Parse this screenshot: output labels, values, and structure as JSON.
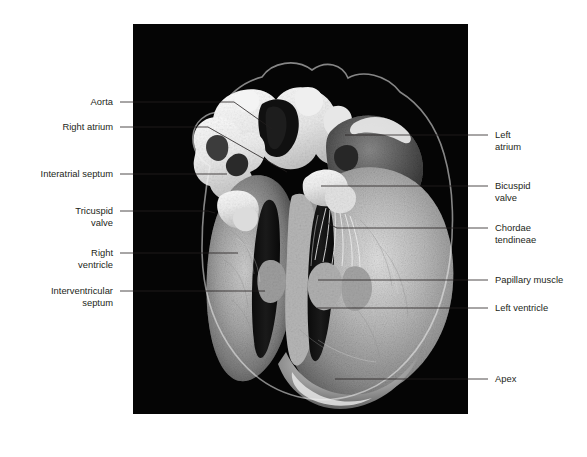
{
  "figure": {
    "type": "anatomical-photograph",
    "photo_style": "black-and-white dissection photograph on black background",
    "background_color": "#ffffff",
    "photo_background_color": "#050505",
    "label_color": "#231f20",
    "leader_color": "#231f20",
    "photo_frame": {
      "x": 133,
      "y": 24,
      "width": 335,
      "height": 390
    }
  },
  "labels_left": [
    {
      "id": "aorta",
      "text": "Aorta",
      "lines": [
        "Aorta"
      ],
      "text_anchor_x": 113,
      "text_y": 105,
      "leader": {
        "x1": 120,
        "y1": 102,
        "x2": 234,
        "y2": 102,
        "x3": 272,
        "y3": 129
      }
    },
    {
      "id": "right-atrium",
      "text": "Right atrium",
      "lines": [
        "Right atrium"
      ],
      "text_anchor_x": 113,
      "text_y": 130,
      "leader": {
        "x1": 120,
        "y1": 127,
        "x2": 208,
        "y2": 127,
        "x3": 287,
        "y3": 172
      }
    },
    {
      "id": "interatrial-septum",
      "text": "Interatrial septum",
      "lines": [
        "Interatrial septum"
      ],
      "text_anchor_x": 113,
      "text_y": 177,
      "leader": {
        "x1": 120,
        "y1": 174,
        "x2": 227,
        "y2": 174,
        "x3": 227,
        "y3": 174
      }
    },
    {
      "id": "tricuspid-valve",
      "text": "Tricuspid valve",
      "lines": [
        "Tricuspid",
        "valve"
      ],
      "text_anchor_x": 113,
      "text_y": 214,
      "leader": {
        "x1": 120,
        "y1": 211,
        "x2": 208,
        "y2": 211,
        "x3": 215,
        "y3": 213
      }
    },
    {
      "id": "right-ventricle",
      "text": "Right ventricle",
      "lines": [
        "Right",
        "ventricle"
      ],
      "text_anchor_x": 113,
      "text_y": 256,
      "leader": {
        "x1": 120,
        "y1": 253,
        "x2": 238,
        "y2": 253,
        "x3": 238,
        "y3": 253
      }
    },
    {
      "id": "interventricular-septum",
      "text": "Interventricular septum",
      "lines": [
        "Interventricular",
        "septum"
      ],
      "text_anchor_x": 113,
      "text_y": 294,
      "leader": {
        "x1": 120,
        "y1": 291,
        "x2": 265,
        "y2": 291,
        "x3": 265,
        "y3": 291
      }
    }
  ],
  "labels_right": [
    {
      "id": "left-atrium",
      "text": "Left atrium",
      "lines": [
        "Left",
        "atrium"
      ],
      "text_anchor_x": 495,
      "text_y": 138,
      "leader": {
        "x1": 488,
        "y1": 135,
        "x2": 345,
        "y2": 135,
        "x3": 345,
        "y3": 135
      }
    },
    {
      "id": "bicuspid-valve",
      "text": "Bicuspid valve",
      "lines": [
        "Bicuspid",
        "valve"
      ],
      "text_anchor_x": 495,
      "text_y": 189,
      "leader": {
        "x1": 488,
        "y1": 186,
        "x2": 321,
        "y2": 186,
        "x3": 321,
        "y3": 186
      }
    },
    {
      "id": "chordae-tendineae",
      "text": "Chordae tendineae",
      "lines": [
        "Chordae",
        "tendineae"
      ],
      "text_anchor_x": 495,
      "text_y": 231,
      "leader": {
        "x1": 488,
        "y1": 228,
        "x2": 337,
        "y2": 228,
        "x3": 327,
        "y3": 223
      }
    },
    {
      "id": "papillary-muscle",
      "text": "Papillary muscle",
      "lines": [
        "Papillary muscle"
      ],
      "text_anchor_x": 495,
      "text_y": 283,
      "leader": {
        "x1": 488,
        "y1": 280,
        "x2": 318,
        "y2": 280,
        "x3": 318,
        "y3": 280
      }
    },
    {
      "id": "left-ventricle",
      "text": "Left ventricle",
      "lines": [
        "Left ventricle"
      ],
      "text_anchor_x": 495,
      "text_y": 311,
      "leader": {
        "x1": 488,
        "y1": 308,
        "x2": 317,
        "y2": 308,
        "x3": 317,
        "y3": 308
      }
    },
    {
      "id": "apex",
      "text": "Apex",
      "lines": [
        "Apex"
      ],
      "text_anchor_x": 495,
      "text_y": 382,
      "leader": {
        "x1": 488,
        "y1": 379,
        "x2": 335,
        "y2": 379,
        "x3": 335,
        "y3": 379
      }
    }
  ]
}
